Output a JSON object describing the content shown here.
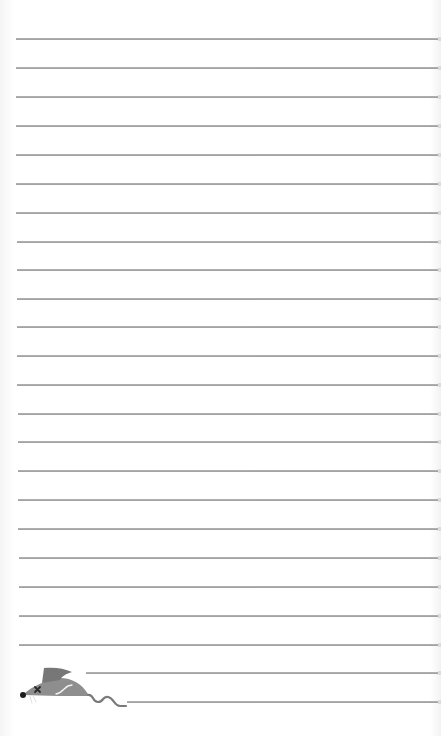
{
  "page": {
    "type": "lined-notepaper",
    "background_color": "#ffffff",
    "line_color": "#999999",
    "line_spacing_px": 28.7,
    "lines": [
      {
        "y": 38,
        "x": 16
      },
      {
        "y": 67,
        "x": 16
      },
      {
        "y": 96,
        "x": 16
      },
      {
        "y": 125,
        "x": 16
      },
      {
        "y": 154,
        "x": 16
      },
      {
        "y": 183,
        "x": 16
      },
      {
        "y": 212,
        "x": 16
      },
      {
        "y": 241,
        "x": 17
      },
      {
        "y": 269,
        "x": 17
      },
      {
        "y": 298,
        "x": 17
      },
      {
        "y": 326,
        "x": 17
      },
      {
        "y": 355,
        "x": 17
      },
      {
        "y": 384,
        "x": 17
      },
      {
        "y": 413,
        "x": 18
      },
      {
        "y": 441,
        "x": 18
      },
      {
        "y": 470,
        "x": 18
      },
      {
        "y": 499,
        "x": 18
      },
      {
        "y": 528,
        "x": 18
      },
      {
        "y": 557,
        "x": 19
      },
      {
        "y": 586,
        "x": 19
      },
      {
        "y": 615,
        "x": 19
      },
      {
        "y": 644,
        "x": 19
      },
      {
        "y": 672,
        "x": 86
      },
      {
        "y": 701,
        "x": 127
      }
    ]
  },
  "illustration": {
    "icon": "mouse-icon",
    "description": "gray cartoon mouse with x-eye and curly tail",
    "body_color": "#8c8c8c",
    "ear_color": "#7a7a7a",
    "nose_color": "#222222"
  }
}
